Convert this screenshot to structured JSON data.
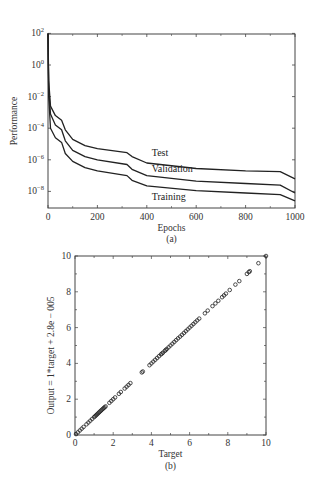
{
  "chart_data": [
    {
      "type": "line",
      "panel": "(a)",
      "caption": "(a)",
      "title": "",
      "xlabel": "Epochs",
      "ylabel": "Performance",
      "xscale": "linear",
      "yscale": "log",
      "xlim": [
        0,
        1000
      ],
      "ylim": [
        1e-09,
        100
      ],
      "xticks": [
        0,
        200,
        400,
        600,
        800,
        1000
      ],
      "xtick_labels": [
        "0",
        "200",
        "400",
        "600",
        "800",
        "1000"
      ],
      "yticks_log10": [
        2,
        0,
        -2,
        -4,
        -6,
        -8
      ],
      "ytick_labels": [
        {
          "base": "10",
          "exp": "2"
        },
        {
          "base": "10",
          "exp": "0"
        },
        {
          "base": "10",
          "exp": "−2"
        },
        {
          "base": "10",
          "exp": "−4"
        },
        {
          "base": "10",
          "exp": "−6"
        },
        {
          "base": "10",
          "exp": "−8"
        }
      ],
      "grid": false,
      "legend": "inline labels",
      "series": [
        {
          "name": "Test",
          "label_pos": {
            "epoch": 420,
            "log10": -5.75
          },
          "x": [
            0,
            3,
            10,
            30,
            55,
            70,
            100,
            150,
            200,
            320,
            340,
            400,
            600,
            800,
            940,
            1000
          ],
          "log10_values": [
            2,
            -1,
            -2.6,
            -3.2,
            -3.5,
            -4.1,
            -4.7,
            -5.1,
            -5.3,
            -5.55,
            -5.8,
            -6.2,
            -6.55,
            -6.7,
            -6.75,
            -7.2
          ]
        },
        {
          "name": "Validation",
          "label_pos": {
            "epoch": 420,
            "log10": -6.75
          },
          "x": [
            0,
            3,
            10,
            30,
            55,
            70,
            100,
            150,
            200,
            320,
            340,
            400,
            600,
            800,
            940,
            1000
          ],
          "log10_values": [
            2,
            -1.5,
            -3.1,
            -3.8,
            -4.1,
            -4.8,
            -5.4,
            -5.8,
            -6.0,
            -6.3,
            -6.6,
            -7.0,
            -7.35,
            -7.5,
            -7.6,
            -8.1
          ]
        },
        {
          "name": "Training",
          "label_pos": {
            "epoch": 420,
            "log10": -8.55
          },
          "x": [
            0,
            3,
            10,
            30,
            55,
            70,
            100,
            150,
            200,
            320,
            340,
            400,
            600,
            800,
            940,
            1000
          ],
          "log10_values": [
            2,
            -2,
            -4,
            -4.6,
            -4.9,
            -5.6,
            -6.1,
            -6.5,
            -6.7,
            -7.0,
            -7.3,
            -7.65,
            -7.95,
            -8.1,
            -8.2,
            -8.6
          ]
        }
      ]
    },
    {
      "type": "scatter",
      "panel": "(b)",
      "caption": "(b)",
      "title": "",
      "xlabel": "Target",
      "ylabel": "Output = 1*target + 2.8e − 005",
      "xlim": [
        0,
        10
      ],
      "ylim": [
        0,
        10
      ],
      "xticks": [
        0,
        2,
        4,
        6,
        8,
        10
      ],
      "xtick_labels": [
        "0",
        "2",
        "4",
        "6",
        "8",
        "10"
      ],
      "yticks": [
        0,
        2,
        4,
        6,
        8,
        10
      ],
      "ytick_labels": [
        "0",
        "2",
        "4",
        "6",
        "8",
        "10"
      ],
      "grid": false,
      "marker": "open circle",
      "series": [
        {
          "name": "Data",
          "x": [
            0.05,
            0.15,
            0.25,
            0.35,
            0.45,
            0.6,
            0.7,
            0.8,
            0.9,
            1.0,
            1.05,
            1.1,
            1.15,
            1.2,
            1.25,
            1.3,
            1.35,
            1.4,
            1.45,
            1.5,
            1.55,
            1.6,
            1.8,
            1.9,
            2.0,
            2.1,
            2.3,
            2.4,
            2.6,
            2.7,
            2.8,
            2.9,
            3.5,
            3.55,
            3.9,
            4.0,
            4.1,
            4.2,
            4.3,
            4.4,
            4.5,
            4.55,
            4.6,
            4.7,
            4.75,
            4.8,
            4.9,
            5.0,
            5.1,
            5.2,
            5.3,
            5.4,
            5.5,
            5.6,
            5.7,
            5.8,
            5.9,
            6.0,
            6.1,
            6.2,
            6.3,
            6.4,
            6.5,
            6.8,
            6.95,
            7.2,
            7.35,
            7.5,
            7.7,
            7.8,
            7.9,
            8.1,
            8.4,
            8.6,
            9.0,
            9.1,
            9.15,
            9.6,
            10.0
          ],
          "y": [
            0.05,
            0.15,
            0.25,
            0.35,
            0.45,
            0.6,
            0.7,
            0.8,
            0.9,
            1.0,
            1.05,
            1.1,
            1.15,
            1.2,
            1.25,
            1.3,
            1.35,
            1.4,
            1.45,
            1.5,
            1.55,
            1.6,
            1.8,
            1.9,
            2.0,
            2.1,
            2.3,
            2.4,
            2.6,
            2.7,
            2.8,
            2.9,
            3.5,
            3.55,
            3.9,
            4.0,
            4.1,
            4.2,
            4.3,
            4.4,
            4.5,
            4.55,
            4.6,
            4.7,
            4.75,
            4.8,
            4.9,
            5.0,
            5.1,
            5.2,
            5.3,
            5.4,
            5.5,
            5.6,
            5.7,
            5.8,
            5.9,
            6.0,
            6.1,
            6.2,
            6.3,
            6.4,
            6.5,
            6.8,
            6.95,
            7.2,
            7.35,
            7.5,
            7.7,
            7.8,
            7.9,
            8.1,
            8.4,
            8.6,
            9.0,
            9.1,
            9.15,
            9.6,
            10.0
          ]
        }
      ]
    }
  ],
  "colors": {
    "line": "#222222",
    "axis": "#444444",
    "text": "#333333",
    "background": "#ffffff"
  }
}
